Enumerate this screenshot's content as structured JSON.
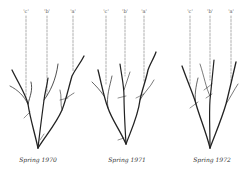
{
  "figure": {
    "panels": [
      {
        "caption": "Spring 1970",
        "labels": [
          "'c'",
          "'b'",
          "'a'"
        ]
      },
      {
        "caption": "Spring 1971",
        "labels": [
          "'c'",
          "'b'",
          "'a'"
        ]
      },
      {
        "caption": "Spring 1972",
        "labels": [
          "'c'",
          "'b'",
          "'a'"
        ]
      }
    ],
    "colors": {
      "ink": "#222222",
      "dash": "#777777",
      "background": "#ffffff"
    }
  }
}
